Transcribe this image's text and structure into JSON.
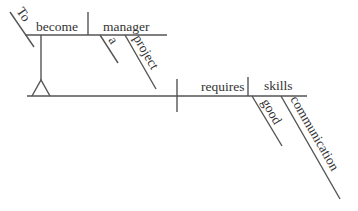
{
  "diagram": {
    "type": "sentence-diagram",
    "sentence": "To become a project manager requires good communication skills",
    "colors": {
      "line": "#555555",
      "text": "#333333",
      "background": "#ffffff"
    },
    "subject_phrase": {
      "infinitive_marker": "To",
      "verb": "become",
      "complement": "manager",
      "complement_modifiers": [
        "a",
        "project"
      ]
    },
    "predicate": {
      "verb": "requires",
      "object": "skills",
      "object_modifiers": [
        "good",
        "communication"
      ]
    }
  }
}
